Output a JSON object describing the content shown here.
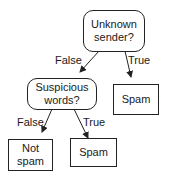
{
  "diagram": {
    "type": "decision-tree",
    "nodes": {
      "root": {
        "label": "Unknown sender?",
        "line1": "Unknown",
        "line2": "sender?",
        "kind": "decision"
      },
      "suspicious": {
        "label": "Suspicious words?",
        "line1": "Suspicious",
        "line2": "words?",
        "kind": "decision"
      },
      "spam_right": {
        "label": "Spam",
        "kind": "leaf"
      },
      "not_spam": {
        "label": "Not spam",
        "line1": "Not",
        "line2": "spam",
        "kind": "leaf"
      },
      "spam_bottom": {
        "label": "Spam",
        "kind": "leaf"
      }
    },
    "edges": [
      {
        "from": "root",
        "to": "suspicious",
        "label": "False"
      },
      {
        "from": "root",
        "to": "spam_right",
        "label": "True"
      },
      {
        "from": "suspicious",
        "to": "not_spam",
        "label": "False"
      },
      {
        "from": "suspicious",
        "to": "spam_bottom",
        "label": "True"
      }
    ]
  }
}
